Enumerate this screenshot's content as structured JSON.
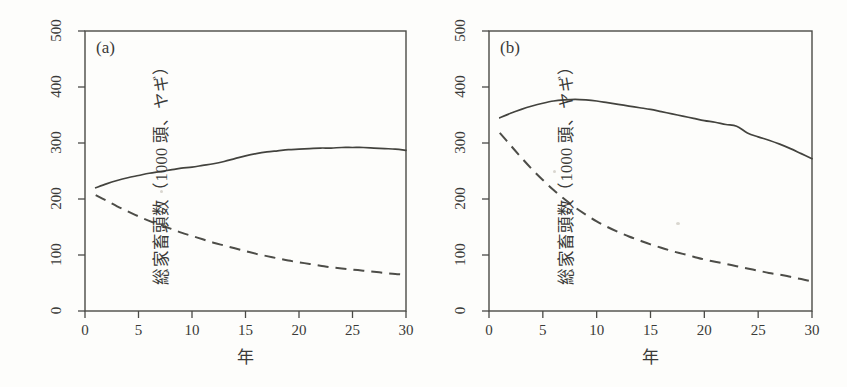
{
  "figure": {
    "background_color": "#fdfdfb",
    "ink_color": "#43433e",
    "panels": [
      {
        "tag": "(a)",
        "xlabel": "年",
        "ylabel": "総家畜頭数（1000 頭、ヤギ）"
      },
      {
        "tag": "(b)",
        "xlabel": "年",
        "ylabel": "総家畜頭数（1000 頭、ヤギ）"
      }
    ]
  },
  "chart_data": [
    {
      "type": "line",
      "panel": "(a)",
      "title": "(a)",
      "xlabel": "年",
      "ylabel": "総家畜頭数（1000 頭、ヤギ）",
      "xlim": [
        0,
        30
      ],
      "ylim": [
        0,
        500
      ],
      "xticks": [
        0,
        5,
        10,
        15,
        20,
        25,
        30
      ],
      "xtick_labels": [
        "0",
        "5",
        "10",
        "15",
        "20",
        "25",
        "30"
      ],
      "yticks": [
        0,
        100,
        200,
        300,
        400,
        500
      ],
      "ytick_labels": [
        "0",
        "100",
        "200",
        "300",
        "400",
        "500"
      ],
      "grid": false,
      "legend": "none",
      "x": [
        1,
        2,
        3,
        4,
        5,
        6,
        7,
        8,
        9,
        10,
        11,
        12,
        13,
        14,
        15,
        16,
        17,
        18,
        19,
        20,
        21,
        22,
        23,
        24,
        25,
        26,
        27,
        28,
        29,
        30
      ],
      "series": [
        {
          "name": "solid",
          "style": "solid",
          "values": [
            220,
            227,
            233,
            238,
            242,
            246,
            249,
            252,
            255,
            257,
            260,
            263,
            267,
            272,
            277,
            281,
            284,
            286,
            288,
            289,
            290,
            291,
            291,
            292,
            292,
            292,
            291,
            290,
            289,
            287
          ]
        },
        {
          "name": "dashed",
          "style": "dashed",
          "values": [
            207,
            197,
            187,
            178,
            169,
            161,
            154,
            147,
            140,
            134,
            128,
            122,
            117,
            112,
            107,
            102,
            98,
            94,
            90,
            87,
            84,
            81,
            78,
            76,
            74,
            72,
            70,
            68,
            66,
            65
          ]
        }
      ]
    },
    {
      "type": "line",
      "panel": "(b)",
      "title": "(b)",
      "xlabel": "年",
      "ylabel": "総家畜頭数（1000 頭、ヤギ）",
      "xlim": [
        0,
        30
      ],
      "ylim": [
        0,
        500
      ],
      "xticks": [
        0,
        5,
        10,
        15,
        20,
        25,
        30
      ],
      "xtick_labels": [
        "0",
        "5",
        "10",
        "15",
        "20",
        "25",
        "30"
      ],
      "yticks": [
        0,
        100,
        200,
        300,
        400,
        500
      ],
      "ytick_labels": [
        "0",
        "100",
        "200",
        "300",
        "400",
        "500"
      ],
      "grid": false,
      "legend": "none",
      "x": [
        1,
        2,
        3,
        4,
        5,
        6,
        7,
        8,
        9,
        10,
        11,
        12,
        13,
        14,
        15,
        16,
        17,
        18,
        19,
        20,
        21,
        22,
        23,
        24,
        25,
        26,
        27,
        28,
        29,
        30
      ],
      "series": [
        {
          "name": "solid",
          "style": "solid",
          "values": [
            345,
            353,
            360,
            366,
            371,
            375,
            377,
            378,
            377,
            375,
            372,
            369,
            366,
            363,
            360,
            356,
            352,
            348,
            344,
            340,
            337,
            333,
            330,
            318,
            311,
            305,
            298,
            290,
            281,
            272
          ]
        },
        {
          "name": "dashed",
          "style": "dashed",
          "values": [
            318,
            296,
            274,
            253,
            234,
            216,
            200,
            185,
            172,
            160,
            150,
            141,
            133,
            126,
            119,
            113,
            107,
            102,
            97,
            92,
            88,
            84,
            80,
            76,
            72,
            68,
            65,
            61,
            57,
            53
          ]
        }
      ]
    }
  ]
}
